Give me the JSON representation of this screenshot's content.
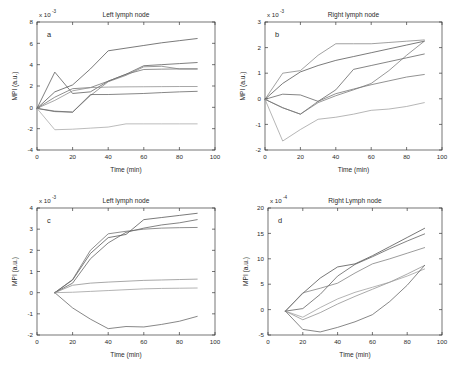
{
  "figure": {
    "background": "#ffffff",
    "panel_count": 4
  },
  "chart_data": [
    {
      "id": "panel-a",
      "type": "line",
      "title": "Left lymph node",
      "panel_letter": "a",
      "xlabel": "Time (min)",
      "ylabel": "MPI (a.u.)",
      "x_exponent_base": "x 10",
      "y_scale_exponent": "-3",
      "y_scale_label": "x 10",
      "xlim": [
        0,
        100
      ],
      "ylim": [
        -4,
        8
      ],
      "xticks": [
        0,
        20,
        40,
        60,
        80,
        100
      ],
      "yticks": [
        -4,
        -2,
        0,
        2,
        4,
        6,
        8
      ],
      "grid": false,
      "legend": "none",
      "x": [
        0,
        10,
        20,
        30,
        40,
        50,
        60,
        70,
        80,
        90
      ],
      "series": [
        {
          "name": "s1",
          "color": "#4d4d4d",
          "values": [
            -0.1,
            1.45,
            2.1,
            3.6,
            5.3,
            5.55,
            5.8,
            6.05,
            6.25,
            6.45
          ]
        },
        {
          "name": "s2",
          "color": "#555555",
          "values": [
            -0.1,
            3.3,
            1.3,
            1.45,
            2.45,
            3.1,
            3.9,
            4.0,
            4.1,
            4.2
          ]
        },
        {
          "name": "s3",
          "color": "#6b6b6b",
          "values": [
            -0.1,
            0.95,
            1.75,
            1.85,
            2.45,
            3.1,
            3.55,
            3.58,
            3.6,
            3.6
          ]
        },
        {
          "name": "s4",
          "color": "#7a7a7a",
          "values": [
            -0.1,
            -0.35,
            -0.45,
            1.1,
            2.4,
            3.0,
            3.8,
            3.85,
            3.6,
            3.6
          ]
        },
        {
          "name": "s5",
          "color": "#8a8a8a",
          "values": [
            -0.1,
            0.65,
            1.55,
            1.85,
            1.9,
            1.92,
            1.93,
            1.94,
            1.95,
            1.95
          ]
        },
        {
          "name": "s6",
          "color": "#5f5f5f",
          "values": [
            -0.1,
            -0.4,
            -0.45,
            1.2,
            1.2,
            1.25,
            1.3,
            1.38,
            1.45,
            1.5
          ]
        },
        {
          "name": "s7",
          "color": "#a5a5a5",
          "values": [
            -0.1,
            -2.1,
            -2.05,
            -1.95,
            -1.85,
            -1.55,
            -1.55,
            -1.55,
            -1.55,
            -1.55
          ]
        }
      ]
    },
    {
      "id": "panel-b",
      "type": "line",
      "title": "Right lymph node",
      "panel_letter": "b",
      "xlabel": "Time (min)",
      "ylabel": "MPI (a.u.)",
      "y_scale_exponent": "-3",
      "y_scale_label": "x 10",
      "xlim": [
        0,
        100
      ],
      "ylim": [
        -2,
        3
      ],
      "xticks": [
        0,
        20,
        40,
        60,
        80,
        100
      ],
      "yticks": [
        -2,
        -1,
        0,
        1,
        2,
        3
      ],
      "grid": false,
      "legend": "none",
      "x": [
        0,
        10,
        20,
        30,
        40,
        50,
        60,
        70,
        80,
        90
      ],
      "series": [
        {
          "name": "s1",
          "color": "#828282",
          "values": [
            -0.02,
            1.0,
            1.1,
            1.7,
            2.15,
            2.15,
            2.15,
            2.2,
            2.25,
            2.3
          ]
        },
        {
          "name": "s2",
          "color": "#4f4f4f",
          "values": [
            -0.02,
            0.6,
            1.05,
            1.3,
            1.5,
            1.65,
            1.8,
            1.95,
            2.1,
            2.25
          ]
        },
        {
          "name": "s3",
          "color": "#5c5c5c",
          "values": [
            -0.02,
            0.18,
            0.15,
            -0.1,
            0.35,
            1.15,
            1.3,
            1.45,
            1.6,
            1.75
          ]
        },
        {
          "name": "s4",
          "color": "#6e6e6e",
          "values": [
            -0.02,
            -0.35,
            -0.6,
            -0.1,
            0.2,
            0.38,
            0.55,
            0.7,
            0.85,
            0.95
          ]
        },
        {
          "name": "s5",
          "color": "#767676",
          "values": [
            -0.02,
            -0.35,
            -0.6,
            -0.15,
            0.12,
            0.35,
            0.6,
            1.1,
            1.7,
            2.25
          ]
        },
        {
          "name": "s6",
          "color": "#9e9e9e",
          "values": [
            -0.02,
            -1.65,
            -1.2,
            -0.8,
            -0.72,
            -0.6,
            -0.45,
            -0.4,
            -0.3,
            -0.15
          ]
        }
      ]
    },
    {
      "id": "panel-c",
      "type": "line",
      "title": "Left lymph node",
      "panel_letter": "c",
      "xlabel": "Time (min)",
      "ylabel": "MPI (a.u.)",
      "y_scale_exponent": "-3",
      "y_scale_label": "x 10",
      "xlim": [
        0,
        100
      ],
      "ylim": [
        -2,
        4
      ],
      "xticks": [
        0,
        20,
        40,
        60,
        80,
        100
      ],
      "yticks": [
        -2,
        -1,
        0,
        1,
        2,
        3,
        4
      ],
      "grid": false,
      "legend": "none",
      "x": [
        10,
        20,
        30,
        40,
        50,
        60,
        70,
        80,
        90
      ],
      "series": [
        {
          "name": "s1",
          "color": "#4d4d4d",
          "values": [
            0.0,
            0.6,
            1.85,
            2.6,
            2.75,
            3.45,
            3.55,
            3.65,
            3.75
          ]
        },
        {
          "name": "s2",
          "color": "#595959",
          "values": [
            0.0,
            0.45,
            1.6,
            2.35,
            2.85,
            3.05,
            3.2,
            3.3,
            3.45
          ]
        },
        {
          "name": "s3",
          "color": "#6a6a6a",
          "values": [
            0.0,
            0.62,
            2.0,
            2.78,
            2.9,
            3.0,
            3.05,
            3.07,
            3.08
          ]
        },
        {
          "name": "s4",
          "color": "#8b8b8b",
          "values": [
            0.0,
            0.35,
            0.45,
            0.5,
            0.54,
            0.58,
            0.6,
            0.62,
            0.64
          ]
        },
        {
          "name": "s5",
          "color": "#9a9a9a",
          "values": [
            0.0,
            0.02,
            0.06,
            0.1,
            0.14,
            0.18,
            0.2,
            0.21,
            0.22
          ]
        },
        {
          "name": "s6",
          "color": "#5f5f5f",
          "values": [
            0.0,
            -0.72,
            -1.25,
            -1.7,
            -1.6,
            -1.62,
            -1.5,
            -1.35,
            -1.12
          ]
        }
      ]
    },
    {
      "id": "panel-d",
      "type": "line",
      "title": "Right Lymph node",
      "panel_letter": "d",
      "xlabel": "Time (min)",
      "ylabel": "MPI (a.u.)",
      "y_scale_exponent": "-4",
      "y_scale_label": "x 10",
      "xlim": [
        0,
        100
      ],
      "ylim": [
        -5,
        20
      ],
      "xticks": [
        0,
        20,
        40,
        60,
        80,
        100
      ],
      "yticks": [
        -5,
        0,
        5,
        10,
        15,
        20
      ],
      "grid": false,
      "legend": "none",
      "x": [
        10,
        20,
        30,
        40,
        50,
        60,
        70,
        80,
        90
      ],
      "series": [
        {
          "name": "s1",
          "color": "#4a4a4a",
          "values": [
            -0.3,
            3.2,
            6.2,
            8.4,
            9.0,
            10.6,
            12.4,
            14.2,
            16.0
          ]
        },
        {
          "name": "s2",
          "color": "#5a5a5a",
          "values": [
            -0.3,
            0.2,
            3.0,
            6.6,
            8.9,
            10.4,
            12.0,
            13.5,
            14.9
          ]
        },
        {
          "name": "s3",
          "color": "#7b7b7b",
          "values": [
            -0.3,
            3.3,
            4.2,
            5.2,
            7.2,
            9.0,
            10.0,
            11.1,
            12.2
          ]
        },
        {
          "name": "s4",
          "color": "#8e8e8e",
          "values": [
            -0.3,
            -2.0,
            -0.6,
            1.1,
            2.6,
            4.0,
            5.4,
            7.0,
            8.7
          ]
        },
        {
          "name": "s5",
          "color": "#9b9b9b",
          "values": [
            -0.3,
            -1.5,
            0.4,
            2.1,
            3.4,
            4.4,
            5.4,
            6.6,
            8.0
          ]
        },
        {
          "name": "s6",
          "color": "#5f5f5f",
          "values": [
            -0.3,
            -3.9,
            -4.4,
            -3.5,
            -2.4,
            -1.0,
            1.6,
            4.8,
            8.7
          ]
        }
      ]
    }
  ]
}
